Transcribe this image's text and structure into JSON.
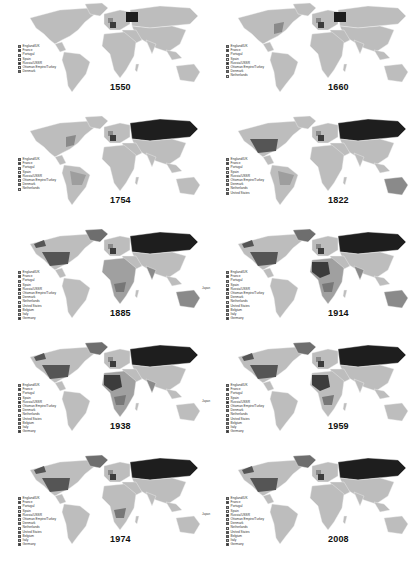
{
  "colors": {
    "land_default": "#bdbdbd",
    "ocean": "#ffffff",
    "england_uk": "#8a8a8a",
    "france": "#3c3c3c",
    "portugal": "#9e9e9e",
    "spain": "#e3e3e3",
    "russia_ussr": "#1e1e1e",
    "ottoman_turkey": "#cfcfcf",
    "denmark": "#6e6e6e",
    "netherlands": "#d6d6d6",
    "united_states": "#555555",
    "belgium": "#777777",
    "italy": "#a8a8a8",
    "germany": "#2e2e2e"
  },
  "japan_label": "Japan",
  "panels": [
    {
      "year": "1550",
      "legend": [
        "England/UK",
        "France",
        "Portugal",
        "Spain",
        "Russia/USSR",
        "Ottoman Empire/Turkey",
        "Denmark"
      ]
    },
    {
      "year": "1660",
      "legend": [
        "England/UK",
        "France",
        "Portugal",
        "Spain",
        "Russia/USSR",
        "Ottoman Empire/Turkey",
        "Denmark",
        "Netherlands"
      ]
    },
    {
      "year": "1754",
      "legend": [
        "England/UK",
        "France",
        "Portugal",
        "Spain",
        "Russia/USSR",
        "Ottoman Empire/Turkey",
        "Denmark",
        "Netherlands"
      ]
    },
    {
      "year": "1822",
      "legend": [
        "England/UK",
        "France",
        "Portugal",
        "Spain",
        "Russia/USSR",
        "Ottoman Empire/Turkey",
        "Denmark",
        "Netherlands",
        "United States"
      ]
    },
    {
      "year": "1885",
      "legend": [
        "England/UK",
        "France",
        "Portugal",
        "Spain",
        "Russia/USSR",
        "Ottoman Empire/Turkey",
        "Denmark",
        "Netherlands",
        "United States",
        "Belgium",
        "Italy",
        "Germany"
      ]
    },
    {
      "year": "1914",
      "legend": [
        "England/UK",
        "France",
        "Portugal",
        "Spain",
        "Russia/USSR",
        "Ottoman Empire/Turkey",
        "Denmark",
        "Netherlands",
        "United States",
        "Belgium",
        "Italy",
        "Germany"
      ]
    },
    {
      "year": "1938",
      "legend": [
        "England/UK",
        "France",
        "Portugal",
        "Spain",
        "Russia/USSR",
        "Ottoman Empire/Turkey",
        "Denmark",
        "Netherlands",
        "United States",
        "Belgium",
        "Italy",
        "Germany"
      ]
    },
    {
      "year": "1959",
      "legend": [
        "England/UK",
        "France",
        "Portugal",
        "Spain",
        "Russia/USSR",
        "Ottoman Empire/Turkey",
        "Denmark",
        "Netherlands",
        "United States",
        "Belgium",
        "Italy",
        "Germany"
      ]
    },
    {
      "year": "1974",
      "legend": [
        "England/UK",
        "France",
        "Portugal",
        "Spain",
        "Russia/USSR",
        "Ottoman Empire/Turkey",
        "Denmark",
        "Netherlands",
        "United States",
        "Belgium",
        "Italy",
        "Germany"
      ]
    },
    {
      "year": "2008",
      "legend": [
        "England/UK",
        "France",
        "Portugal",
        "Spain",
        "Russia/USSR",
        "Ottoman Empire/Turkey",
        "Denmark",
        "Netherlands",
        "United States",
        "Belgium",
        "Italy",
        "Germany"
      ]
    }
  ]
}
